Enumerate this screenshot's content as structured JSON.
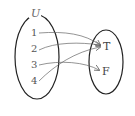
{
  "diagram": {
    "domain_set": {
      "label": "U",
      "elements": [
        "1",
        "2",
        "3",
        "4"
      ]
    },
    "codomain_set": {
      "elements": [
        "T",
        "F"
      ]
    },
    "mapping": [
      {
        "from": "1",
        "to": "T"
      },
      {
        "from": "2",
        "to": "T"
      },
      {
        "from": "3",
        "to": "F"
      },
      {
        "from": "4",
        "to": "T"
      }
    ],
    "colors": {
      "ellipse": "#222222",
      "arrow": "#666666",
      "text": "#555555"
    }
  }
}
